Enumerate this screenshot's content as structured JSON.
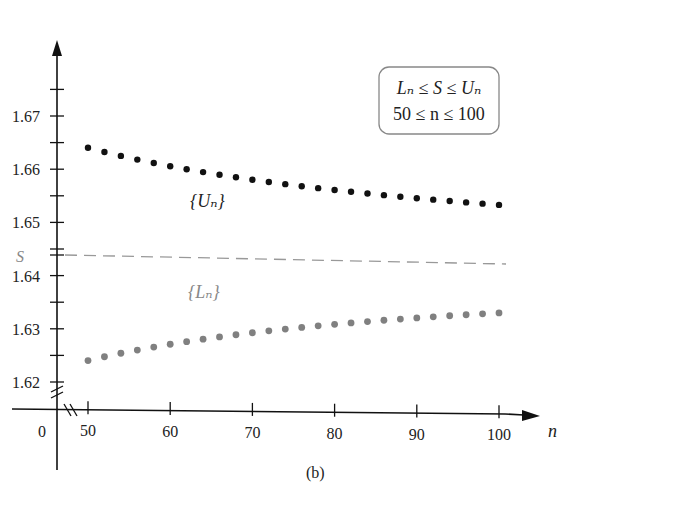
{
  "chart_data": {
    "type": "scatter",
    "title": "",
    "caption": "(b)",
    "xlabel": "n",
    "ylabel": "",
    "xlim": [
      50,
      100
    ],
    "ylim": [
      1.615,
      1.68
    ],
    "x_ticks": [
      50,
      60,
      70,
      80,
      90,
      100
    ],
    "x_tick_labels": [
      "50",
      "60",
      "70",
      "80",
      "90",
      "100"
    ],
    "x_origin_label": "0",
    "y_ticks": [
      1.62,
      1.63,
      1.64,
      1.65,
      1.66,
      1.67
    ],
    "y_tick_labels": [
      "1.62",
      "1.63",
      "1.64",
      "1.65",
      "1.66",
      "1.67"
    ],
    "y_minor_ticks": [
      1.625,
      1.635,
      1.645,
      1.655,
      1.665,
      1.675
    ],
    "axis_breaks": true,
    "grid": false,
    "annotation_box": {
      "line1": "Lₙ ≤ S ≤ Uₙ",
      "line2": "50 ≤ n ≤ 100"
    },
    "reference_line": {
      "label": "S",
      "value": 1.6449,
      "style": "dashed",
      "color": "#999999"
    },
    "series": [
      {
        "name": "{Uₙ}",
        "label": "{Uₙ}",
        "color": "#111111",
        "x_start": 50,
        "x_end": 100,
        "step": 2,
        "values_approx": {
          "n50": 1.664,
          "n60": 1.6602,
          "n70": 1.6576,
          "n80": 1.6558,
          "n90": 1.6543,
          "n100": 1.6525
        }
      },
      {
        "name": "{Lₙ}",
        "label": "{Lₙ}",
        "color": "#808080",
        "x_start": 50,
        "x_end": 100,
        "step": 2,
        "values_approx": {
          "n50": 1.624,
          "n60": 1.6268,
          "n70": 1.6288,
          "n80": 1.6304,
          "n90": 1.6316,
          "n100": 1.6327
        }
      }
    ]
  },
  "labels": {
    "caption": "(b)",
    "x_axis_name": "n",
    "origin": "0",
    "s_label": "S",
    "u_series": "{Uₙ}",
    "l_series": "{Lₙ}",
    "box_line1": "Lₙ ≤ S ≤ Uₙ",
    "box_line2": "50 ≤ n ≤ 100"
  }
}
